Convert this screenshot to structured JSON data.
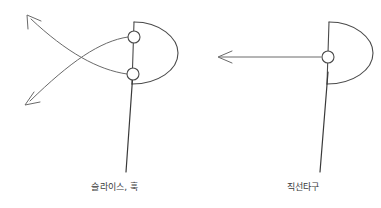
{
  "diagram": {
    "background_color": "#ffffff",
    "stroke_color": "#4a4a4a",
    "shaft_color": "#3a3a3a",
    "figures": [
      {
        "id": "slice-hook",
        "caption": "슬라이스, 훅",
        "club_head": {
          "shape": "D-shape club head, flat face on left, curved back bulging right",
          "face_top_x": 134,
          "face_top_y": 22,
          "face_bottom_x": 132,
          "face_bottom_y": 84,
          "back_bulge_x": 178
        },
        "ball_markers": [
          {
            "name": "upper-ball",
            "cx": 134,
            "cy": 37,
            "r": 6
          },
          {
            "name": "lower-ball",
            "cx": 133,
            "cy": 74,
            "r": 6
          }
        ],
        "shaft": {
          "x1": 133,
          "y1": 72,
          "x2": 126,
          "y2": 172
        },
        "trajectories": [
          {
            "name": "slice-curve",
            "from_marker": "upper-ball",
            "direction": "curves down and to the left",
            "arrow_x": 25,
            "arrow_y": 105
          },
          {
            "name": "hook-curve",
            "from_marker": "lower-ball",
            "direction": "curves up and to the left",
            "arrow_x": 27,
            "arrow_y": 15
          }
        ]
      },
      {
        "id": "straight-shot",
        "caption": "직선타구",
        "club_head": {
          "shape": "D-shape club head, flat face on left, curved back bulging right",
          "face_top_x": 139,
          "face_top_y": 22,
          "face_bottom_x": 137,
          "face_bottom_y": 84,
          "back_bulge_x": 183
        },
        "ball_markers": [
          {
            "name": "center-ball",
            "cx": 138,
            "cy": 57,
            "r": 6
          }
        ],
        "shaft": {
          "x1": 138,
          "y1": 72,
          "x2": 130,
          "y2": 172
        },
        "trajectories": [
          {
            "name": "straight-line",
            "from_marker": "center-ball",
            "direction": "straight horizontal line to the left",
            "arrow_x": 28,
            "arrow_y": 57
          }
        ]
      }
    ]
  }
}
